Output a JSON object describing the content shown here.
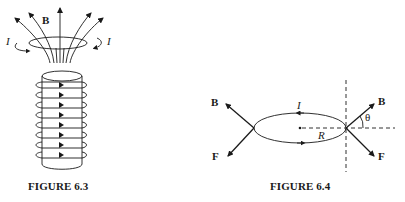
{
  "figures": [
    {
      "caption": "FIGURE 6.3",
      "labels": {
        "field": "B",
        "current_left": "I",
        "current_right": "I"
      },
      "description": "Solenoid with 8 current-carrying turns; magnetic field lines B diverge out of the top end with a circulating current loop I"
    },
    {
      "caption": "FIGURE 6.4",
      "labels": {
        "field_left": "B",
        "force_left": "F",
        "current": "I",
        "radius": "R",
        "field_right": "B",
        "force_right": "F",
        "angle": "θ"
      },
      "description": "Current loop of radius R in diverging field B at angle θ, with forces F"
    }
  ],
  "colors": {
    "ink": "#1a1a1a",
    "background": "#ffffff"
  }
}
